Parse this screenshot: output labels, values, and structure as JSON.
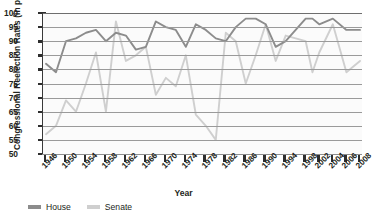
{
  "chart_data": {
    "type": "line",
    "title": "",
    "xlabel": "Year",
    "ylabel": "Congressional Reelection Rates (in percent)",
    "ylim": [
      50,
      100
    ],
    "xlim": [
      1946,
      2008
    ],
    "grid": true,
    "legend_position": "bottom-left",
    "ytick_labels": [
      "100",
      "95",
      "90",
      "85",
      "80",
      "75",
      "70",
      "65",
      "60",
      "55",
      "50"
    ],
    "ytick_values": [
      100,
      95,
      90,
      85,
      80,
      75,
      70,
      65,
      60,
      55,
      50
    ],
    "xtick_labels": [
      "1946",
      "1950",
      "1954",
      "1958",
      "1962",
      "1966",
      "1970",
      "1974",
      "1978",
      "1982",
      "1986",
      "1990",
      "1994",
      "1998",
      "2002",
      "2004",
      "2006",
      "2008"
    ],
    "xtick_values": [
      1946,
      1950,
      1954,
      1958,
      1962,
      1966,
      1970,
      1974,
      1978,
      1982,
      1986,
      1990,
      1994,
      1998,
      2002,
      2004,
      2006,
      2008
    ],
    "x": [
      1946,
      1948,
      1950,
      1952,
      1954,
      1956,
      1958,
      1960,
      1962,
      1964,
      1966,
      1968,
      1970,
      1972,
      1974,
      1976,
      1978,
      1980,
      1982,
      1984,
      1986,
      1988,
      1990,
      1992,
      1994,
      1996,
      1998,
      2000,
      2002,
      2004,
      2006,
      2008
    ],
    "series": [
      {
        "name": "House",
        "color": "#8c8c8c",
        "values": [
          82,
          79,
          90,
          91,
          93,
          94,
          90,
          93,
          92,
          87,
          88,
          97,
          95,
          94,
          88,
          96,
          94,
          91,
          90,
          95,
          98,
          98,
          96,
          88,
          90,
          94,
          98,
          98,
          96,
          98,
          94,
          94
        ]
      },
      {
        "name": "Senate",
        "color": "#cfcfcf",
        "values": [
          57,
          60,
          69,
          65,
          75,
          86,
          65,
          97,
          83,
          85,
          88,
          71,
          77,
          74,
          85,
          64,
          60,
          55,
          93,
          90,
          75,
          85,
          96,
          83,
          92,
          91,
          90,
          79,
          86,
          96,
          79,
          83
        ]
      }
    ]
  },
  "legend": {
    "entries": [
      {
        "label": "House",
        "color": "#8c8c8c"
      },
      {
        "label": "Senate",
        "color": "#cfcfcf"
      }
    ]
  },
  "axes": {
    "y_title": "Congressional Reelection Rates (in percent)",
    "x_title": "Year"
  }
}
